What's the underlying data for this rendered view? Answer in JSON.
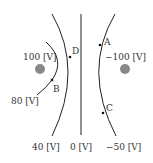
{
  "diagram": {
    "colors": {
      "line": "#222222",
      "charge": "#888888",
      "text": "#333333"
    },
    "charges": [
      {
        "id": "left-charge",
        "potential_label": "100 [V]"
      },
      {
        "id": "right-charge",
        "potential_label": "−100 [V]"
      }
    ],
    "equipotentials": [
      {
        "id": "arc-80",
        "label": "80 [V]"
      },
      {
        "id": "curve-40",
        "label": "40 [V]"
      },
      {
        "id": "line-0",
        "label": "0 [V]"
      },
      {
        "id": "curve-neg50",
        "label": "−50 [V]"
      }
    ],
    "points": [
      {
        "id": "A",
        "label": "A"
      },
      {
        "id": "B",
        "label": "B"
      },
      {
        "id": "C",
        "label": "C"
      },
      {
        "id": "D",
        "label": "D"
      }
    ]
  }
}
